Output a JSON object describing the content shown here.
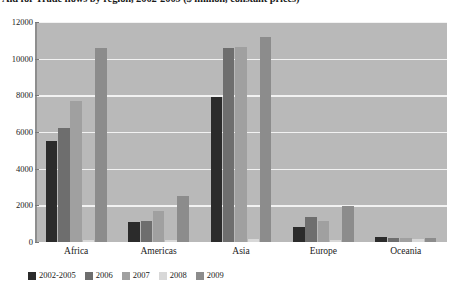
{
  "chart": {
    "title": "Aid for Trade flows by region, 2002-2009 ($ million, constant prices)"
  },
  "chart_data": {
    "type": "bar",
    "title": "Aid for Trade flows by region, 2002-2009 ($ million, constant prices)",
    "xlabel": "",
    "ylabel": "",
    "ylim": [
      0,
      12000
    ],
    "yticks": [
      "12000",
      "10000",
      "8000",
      "6000",
      "4000",
      "2000",
      "0"
    ],
    "ytick_values": [
      12000,
      10000,
      8000,
      6000,
      4000,
      2000,
      0
    ],
    "grid": true,
    "legend_position": "bottom",
    "categories": [
      "Africa",
      "Americas",
      "Asia",
      "Europe",
      "Oceania"
    ],
    "series": [
      {
        "name": "2002-2005",
        "color": "#2b2b2b",
        "values": [
          5500,
          1100,
          7900,
          800,
          250
        ]
      },
      {
        "name": "2006",
        "color": "#6e6e6e",
        "values": [
          6200,
          1150,
          10600,
          1350,
          230
        ]
      },
      {
        "name": "2007",
        "color": "#a0a0a0",
        "values": [
          7700,
          1700,
          10650,
          1150,
          200
        ]
      },
      {
        "name": "2008",
        "color": "#d8d8d8",
        "values": [
          120,
          130,
          140,
          110,
          150
        ]
      },
      {
        "name": "2009",
        "color": "#8c8c8c",
        "values": [
          10600,
          2500,
          11200,
          1950,
          230
        ]
      }
    ]
  },
  "colors": {
    "plot_background": "#b9b9b9",
    "gridline": "#f2f2f2",
    "axis": "#8e8e8e",
    "page_background": "#ffffff",
    "text": "#1a1a1a"
  }
}
